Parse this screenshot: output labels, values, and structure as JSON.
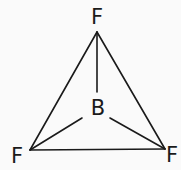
{
  "diagram": {
    "atoms": {
      "top": {
        "label": "F",
        "x": 97,
        "y": 24
      },
      "center": {
        "label": "B",
        "x": 98,
        "y": 115
      },
      "left": {
        "label": "F",
        "x": 17,
        "y": 163
      },
      "right": {
        "label": "F",
        "x": 172,
        "y": 162
      }
    },
    "colors": {
      "background": "#fafafa",
      "ink": "#1a1a1a"
    }
  }
}
